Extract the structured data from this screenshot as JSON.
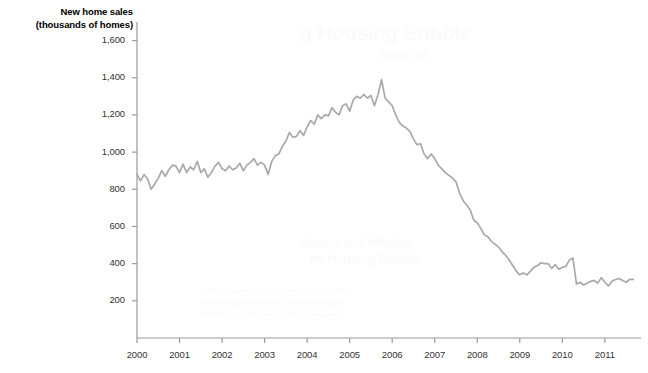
{
  "chart_data": {
    "type": "line",
    "title": "New home sales\n(thousands of homes)",
    "title_line1": "New home sales",
    "title_line2": "(thousands of homes)",
    "xlabel": "",
    "ylabel": "New home sales (thousands of homes)",
    "ylim": [
      0,
      1700
    ],
    "xlim": [
      2000.0,
      2011.8
    ],
    "grid": false,
    "legend": null,
    "line_color": "#a9a9a9",
    "axis_color": "#999999",
    "text_color": "#333333",
    "ytick_labels": [
      "200",
      "400",
      "600",
      "800",
      "1,000",
      "1,200",
      "1,400",
      "1,600"
    ],
    "ytick_values": [
      200,
      400,
      600,
      800,
      1000,
      1200,
      1400,
      1600
    ],
    "xtick_labels": [
      "2000",
      "2001",
      "2002",
      "2003",
      "2004",
      "2005",
      "2006",
      "2007",
      "2008",
      "2009",
      "2010",
      "2011"
    ],
    "xtick_values": [
      2000,
      2001,
      2002,
      2003,
      2004,
      2005,
      2006,
      2007,
      2008,
      2009,
      2010,
      2011
    ],
    "series": [
      {
        "name": "New home sales",
        "x": [
          2000.0,
          2000.083,
          2000.167,
          2000.25,
          2000.333,
          2000.417,
          2000.5,
          2000.583,
          2000.667,
          2000.75,
          2000.833,
          2000.917,
          2001.0,
          2001.083,
          2001.167,
          2001.25,
          2001.333,
          2001.417,
          2001.5,
          2001.583,
          2001.667,
          2001.75,
          2001.833,
          2001.917,
          2002.0,
          2002.083,
          2002.167,
          2002.25,
          2002.333,
          2002.417,
          2002.5,
          2002.583,
          2002.667,
          2002.75,
          2002.833,
          2002.917,
          2003.0,
          2003.083,
          2003.167,
          2003.25,
          2003.333,
          2003.417,
          2003.5,
          2003.583,
          2003.667,
          2003.75,
          2003.833,
          2003.917,
          2004.0,
          2004.083,
          2004.167,
          2004.25,
          2004.333,
          2004.417,
          2004.5,
          2004.583,
          2004.667,
          2004.75,
          2004.833,
          2004.917,
          2005.0,
          2005.083,
          2005.167,
          2005.25,
          2005.333,
          2005.417,
          2005.5,
          2005.583,
          2005.667,
          2005.75,
          2005.833,
          2005.917,
          2006.0,
          2006.083,
          2006.167,
          2006.25,
          2006.333,
          2006.417,
          2006.5,
          2006.583,
          2006.667,
          2006.75,
          2006.833,
          2006.917,
          2007.0,
          2007.083,
          2007.167,
          2007.25,
          2007.333,
          2007.417,
          2007.5,
          2007.583,
          2007.667,
          2007.75,
          2007.833,
          2007.917,
          2008.0,
          2008.083,
          2008.167,
          2008.25,
          2008.333,
          2008.417,
          2008.5,
          2008.583,
          2008.667,
          2008.75,
          2008.833,
          2008.917,
          2009.0,
          2009.083,
          2009.167,
          2009.25,
          2009.333,
          2009.417,
          2009.5,
          2009.583,
          2009.667,
          2009.75,
          2009.833,
          2009.917,
          2010.0,
          2010.083,
          2010.167,
          2010.25,
          2010.333,
          2010.417,
          2010.5,
          2010.583,
          2010.667,
          2010.75,
          2010.833,
          2010.917,
          2011.0,
          2011.083,
          2011.167,
          2011.25,
          2011.333,
          2011.417,
          2011.5,
          2011.583,
          2011.667
        ],
        "values": [
          880,
          845,
          880,
          855,
          800,
          830,
          860,
          900,
          870,
          905,
          930,
          925,
          890,
          935,
          890,
          920,
          905,
          950,
          890,
          910,
          865,
          890,
          925,
          945,
          910,
          900,
          925,
          905,
          915,
          940,
          900,
          930,
          945,
          965,
          930,
          945,
          930,
          880,
          950,
          980,
          990,
          1030,
          1060,
          1105,
          1080,
          1085,
          1115,
          1090,
          1135,
          1170,
          1150,
          1200,
          1180,
          1200,
          1195,
          1240,
          1215,
          1200,
          1250,
          1260,
          1220,
          1280,
          1300,
          1290,
          1310,
          1290,
          1305,
          1250,
          1310,
          1390,
          1290,
          1270,
          1250,
          1200,
          1160,
          1140,
          1130,
          1110,
          1070,
          1040,
          1045,
          990,
          965,
          990,
          965,
          930,
          910,
          890,
          875,
          860,
          840,
          780,
          740,
          715,
          690,
          635,
          620,
          590,
          555,
          545,
          520,
          505,
          490,
          465,
          445,
          420,
          390,
          360,
          340,
          350,
          340,
          360,
          380,
          390,
          405,
          400,
          400,
          375,
          395,
          370,
          380,
          385,
          420,
          430,
          290,
          300,
          285,
          295,
          305,
          310,
          295,
          325,
          300,
          280,
          305,
          315,
          320,
          310,
          300,
          315,
          315
        ]
      }
    ]
  },
  "plot_geometry": {
    "left": 137,
    "right": 641,
    "top": 22,
    "bottom": 338,
    "y_value_at_top": 1700,
    "y_value_at_bottom": 0,
    "x_value_at_left": 2000.0,
    "x_value_at_right": 2011.85
  }
}
